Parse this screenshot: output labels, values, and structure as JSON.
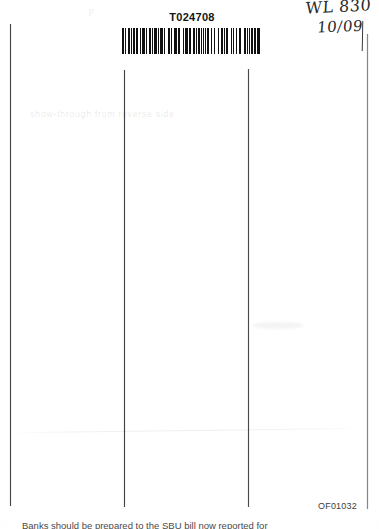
{
  "document": {
    "type": "scanned-document-page",
    "background_color": "#ffffff",
    "ink_color": "#101010"
  },
  "barcode": {
    "number": "T024708",
    "symbology_appearance": "code-39-style vertical bars",
    "bar_color": "#101010"
  },
  "handwriting": {
    "line_1": "WL 830",
    "line_2": "10/09",
    "ink_color": "#2a2a2a",
    "note": "handwritten annotation, right edge partially clipped"
  },
  "ghost_text": {
    "content": "show-through from reverse side",
    "legibility": "illegible"
  },
  "footer": {
    "stamp": "OF01032"
  },
  "body_text": {
    "clipped_line": "Banks should be prepared to the SBU bill now reported for"
  },
  "rules": {
    "vertical_line_1": "left margin rule",
    "vertical_line_2": "first column rule",
    "vertical_line_3": "second column rule",
    "vertical_line_4": "right margin rule"
  },
  "artifacts": {
    "fold_line": "faint horizontal fold crease",
    "smudge": "faint curved smudge",
    "corner_mark": "P"
  }
}
